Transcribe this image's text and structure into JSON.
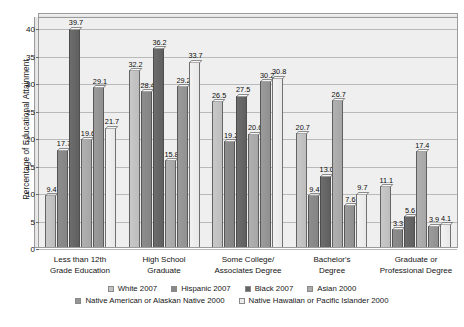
{
  "chart_data": {
    "type": "bar",
    "title": "",
    "xlabel": "",
    "ylabel": "Percentage of Educational Attainment",
    "ylim": [
      0,
      42
    ],
    "yticks": [
      0,
      5,
      10,
      15,
      20,
      25,
      30,
      35,
      40
    ],
    "grid": true,
    "legend_position": "bottom",
    "categories": [
      "Less than 12th\nGrade Education",
      "High School\nGraduate",
      "Some College/\nAssociates Degree",
      "Bachelor's\nDegree",
      "Graduate or\nProfessional Degree"
    ],
    "series": [
      {
        "name": "White 2007",
        "color": "#c2c2c2",
        "values": [
          9.4,
          32.2,
          26.5,
          20.7,
          11.1
        ]
      },
      {
        "name": "Hispanic 2007",
        "color": "#888888",
        "values": [
          17.7,
          28.4,
          19.2,
          9.4,
          3.3
        ]
      },
      {
        "name": "Black 2007",
        "color": "#646464",
        "values": [
          39.7,
          36.2,
          27.5,
          13.0,
          5.6
        ]
      },
      {
        "name": "Asian 2000",
        "color": "#ababab",
        "values": [
          19.6,
          15.8,
          20.6,
          26.7,
          17.4
        ]
      },
      {
        "name": "Native American or Alaskan Native 2000",
        "color": "#959595",
        "values": [
          29.1,
          29.2,
          30.2,
          7.6,
          3.9
        ]
      },
      {
        "name": "Native Hawaiian or Pacific Islander 2000",
        "color": "#ededed",
        "values": [
          21.7,
          33.7,
          30.8,
          9.7,
          4.1
        ]
      }
    ]
  },
  "axis": {
    "y_title": "Percentage of Educational Attainment",
    "y_tick_labels": [
      "0",
      "5",
      "10",
      "15",
      "20",
      "25",
      "30",
      "35",
      "40"
    ]
  },
  "categories_display": [
    {
      "line1": "Less than 12th",
      "line2": "Grade Education"
    },
    {
      "line1": "High School",
      "line2": "Graduate"
    },
    {
      "line1": "Some College/",
      "line2": "Associates Degree"
    },
    {
      "line1": "Bachelor's",
      "line2": "Degree"
    },
    {
      "line1": "Graduate or",
      "line2": "Professional Degree"
    }
  ],
  "legend": {
    "row1": [
      "White 2007",
      "Hispanic 2007",
      "Black 2007",
      "Asian 2000"
    ],
    "row2": [
      "Native American or Alaskan Native 2000",
      "Native Hawaiian or Pacific Islander 2000"
    ]
  }
}
